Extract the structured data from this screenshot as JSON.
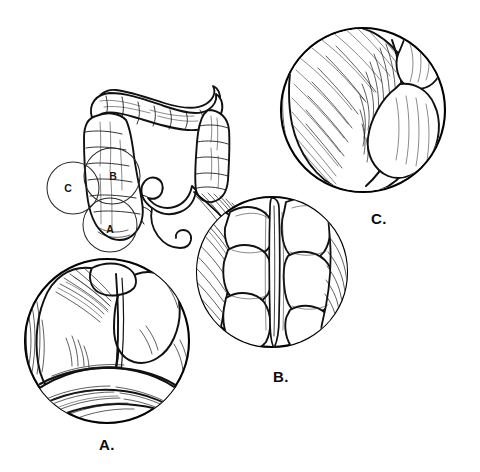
{
  "figure": {
    "background_color": "#ffffff",
    "ink_color": "#111111",
    "style": "black-and-white pen-and-ink line drawing with cross-hatch shading",
    "width": 480,
    "height": 472
  },
  "overview": {
    "name": "colon-overview",
    "description": "Large intestine shown with ascending, transverse, descending and sigmoid colon",
    "locators": [
      {
        "label": "A",
        "cx": 110,
        "cy": 225,
        "r": 27
      },
      {
        "label": "B",
        "cx": 112,
        "cy": 176,
        "r": 28
      },
      {
        "label": "C",
        "cx": 73,
        "cy": 188,
        "r": 26
      }
    ]
  },
  "details": [
    {
      "id": "detail-a",
      "caption": "A.",
      "caption_x": 107,
      "caption_y": 450,
      "cx": 107,
      "cy": 341,
      "r": 83,
      "description": "Close-up of cecum with rounded haustral sacculations and ileocecal fold"
    },
    {
      "id": "detail-b",
      "caption": "B.",
      "caption_x": 281,
      "caption_y": 382,
      "cx": 272,
      "cy": 272,
      "r": 76,
      "description": "Close-up of colon segment showing haustra separated by a longitudinal taenia coli band"
    },
    {
      "id": "detail-c",
      "caption": "C.",
      "caption_x": 379,
      "caption_y": 224,
      "cx": 363,
      "cy": 110,
      "r": 82,
      "description": "Close-up of distended smooth-walled bowel loop with dense diagonal hatch shading"
    }
  ]
}
